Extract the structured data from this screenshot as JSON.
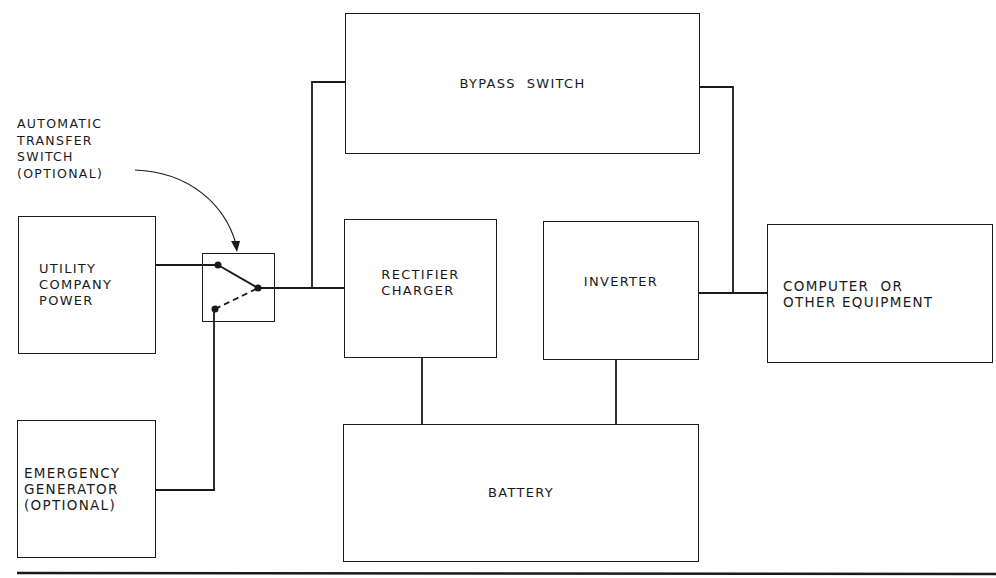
{
  "diagram": {
    "blocks": {
      "utility": {
        "label": "UTILITY\nCOMPANY\nPOWER"
      },
      "emergency": {
        "label": "EMERGENCY\nGENERATOR\n(OPTIONAL)"
      },
      "bypass": {
        "label": "BYPASS  SWITCH"
      },
      "rectifier": {
        "label": "RECTIFIER\nCHARGER"
      },
      "inverter": {
        "label": "INVERTER"
      },
      "computer": {
        "label": "COMPUTER  OR\nOTHER EQUIPMENT"
      },
      "battery": {
        "label": "BATTERY"
      }
    },
    "annotation": {
      "label": "AUTOMATIC\nTRANSFER\nSWITCH\n(OPTIONAL)",
      "target": "transfer-switch"
    },
    "connections": [
      {
        "from": "utility",
        "to": "transfer-switch"
      },
      {
        "from": "emergency",
        "to": "transfer-switch"
      },
      {
        "from": "transfer-switch",
        "to": "rectifier"
      },
      {
        "from": "transfer-switch",
        "to": "bypass"
      },
      {
        "from": "rectifier",
        "to": "battery"
      },
      {
        "from": "inverter",
        "to": "battery"
      },
      {
        "from": "bypass",
        "to": "computer"
      },
      {
        "from": "inverter",
        "to": "computer"
      }
    ],
    "colors": {
      "line": "#1a1a1a",
      "background": "#ffffff"
    }
  }
}
